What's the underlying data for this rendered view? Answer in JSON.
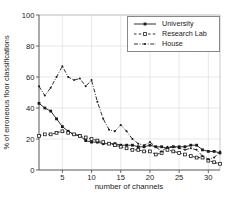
{
  "chart_data": {
    "type": "line",
    "title": "",
    "xlabel": "number of channels",
    "ylabel": "% of erroneous floor classifications",
    "xlim": [
      1,
      32
    ],
    "ylim": [
      0,
      100
    ],
    "xticks": [
      5,
      10,
      15,
      20,
      25,
      30
    ],
    "yticks": [
      0,
      20,
      40,
      60,
      80,
      100
    ],
    "grid": true,
    "grid_color": "#d9d9d9",
    "axis_color": "#444444",
    "frame_light_color": "#bbbbbb",
    "text_color": "#222222",
    "background": "#ffffff",
    "legend_position": "upper right",
    "x": [
      1,
      2,
      3,
      4,
      5,
      6,
      7,
      8,
      9,
      10,
      11,
      12,
      13,
      14,
      15,
      16,
      17,
      18,
      19,
      20,
      21,
      22,
      23,
      24,
      25,
      26,
      27,
      28,
      29,
      30,
      31,
      32
    ],
    "series": [
      {
        "name": "University",
        "line_style": "solid",
        "marker": "filled-square",
        "color": "#1a1a1a",
        "values": [
          43,
          40,
          38,
          33,
          28,
          25,
          23,
          22,
          19,
          18,
          18,
          17,
          17,
          17,
          16,
          16,
          16,
          15,
          15,
          16,
          15,
          15,
          14,
          15,
          15,
          15,
          16,
          16,
          13,
          12,
          12,
          11
        ]
      },
      {
        "name": "Research Lab",
        "line_style": "dashed",
        "marker": "open-square",
        "color": "#1a1a1a",
        "values": [
          22,
          23,
          23,
          24,
          25,
          24,
          23,
          22,
          21,
          20,
          19,
          18,
          17,
          16,
          15,
          14,
          13,
          13,
          12,
          12,
          10,
          11,
          13,
          12,
          11,
          10,
          9,
          8,
          8,
          6,
          5,
          4
        ]
      },
      {
        "name": "House",
        "line_style": "dash-dot",
        "marker": "dot",
        "color": "#1a1a1a",
        "values": [
          54,
          48,
          53,
          60,
          67,
          60,
          58,
          59,
          54,
          58,
          44,
          33,
          26,
          25,
          29,
          25,
          20,
          17,
          16,
          18,
          15,
          12,
          15,
          15,
          14,
          13,
          14,
          13,
          9,
          7,
          8,
          12
        ]
      }
    ]
  }
}
